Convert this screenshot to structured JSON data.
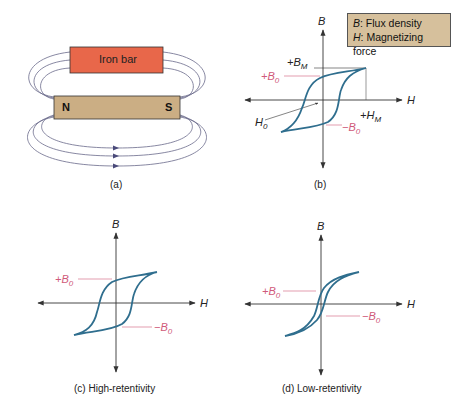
{
  "panel_a": {
    "iron_bar_label": "Iron bar",
    "magnet_north": "N",
    "magnet_south": "S",
    "caption": "(a)",
    "colors": {
      "iron_bar": "#e8674a",
      "magnet": "#cbae84",
      "field_lines": "#6a6a8a"
    }
  },
  "panel_b": {
    "axis_y": "B",
    "axis_x": "H",
    "label_bm": "+B",
    "label_bm_sub": "M",
    "label_b0_pos": "+B",
    "label_b0_pos_sub": "0",
    "label_b0_neg": "−B",
    "label_b0_neg_sub": "0",
    "label_hm": "+H",
    "label_hm_sub": "M",
    "label_h0": "H",
    "label_h0_sub": "0",
    "caption": "(b)"
  },
  "legend": {
    "line1_sym": "B",
    "line1_text": ": Flux density",
    "line2_sym": "H",
    "line2_text": ": Magnetizing force",
    "background": "#d6c09c"
  },
  "panel_c": {
    "axis_y": "B",
    "axis_x": "H",
    "label_b0_pos": "+B",
    "label_b0_pos_sub": "0",
    "label_b0_neg": "−B",
    "label_b0_neg_sub": "0",
    "caption": "(c) High-retentivity"
  },
  "panel_d": {
    "axis_y": "B",
    "axis_x": "H",
    "label_b0_pos": "+B",
    "label_b0_pos_sub": "0",
    "label_b0_neg": "−B",
    "label_b0_neg_sub": "0",
    "caption": "(d) Low-retentivity"
  },
  "colors": {
    "curve": "#2f6e8e",
    "pink": "#d05a7a",
    "axis": "#333333"
  }
}
